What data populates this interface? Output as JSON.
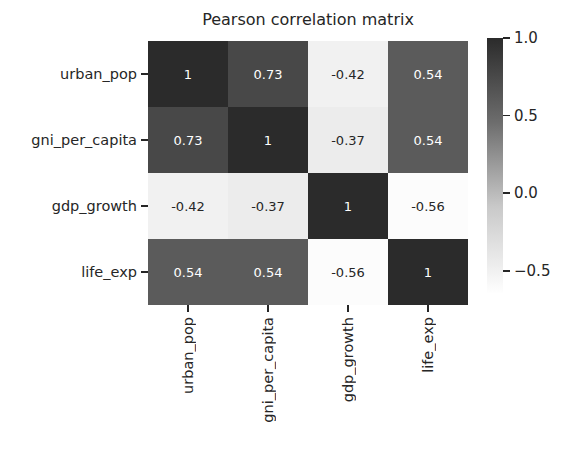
{
  "chart_data": {
    "type": "heatmap",
    "title": "Pearson correlation matrix",
    "xlabel": "",
    "ylabel": "",
    "categories": [
      "urban_pop",
      "gni_per_capita",
      "gdp_growth",
      "life_exp"
    ],
    "x_tick_labels": [
      "urban_pop",
      "gni_per_capita",
      "gdp_growth",
      "life_exp"
    ],
    "y_tick_labels": [
      "urban_pop",
      "gni_per_capita",
      "gdp_growth",
      "life_exp"
    ],
    "rows": [
      {
        "label": "urban_pop",
        "cells": [
          {
            "value": "1",
            "num": 1.0,
            "bg": "#2b2b2b",
            "fg": "#ffffff"
          },
          {
            "value": "0.73",
            "num": 0.73,
            "bg": "#484848",
            "fg": "#ffffff"
          },
          {
            "value": "-0.42",
            "num": -0.42,
            "bg": "#f1f1f1",
            "fg": "#262626"
          },
          {
            "value": "0.54",
            "num": 0.54,
            "bg": "#5b5b5b",
            "fg": "#ffffff"
          }
        ]
      },
      {
        "label": "gni_per_capita",
        "cells": [
          {
            "value": "0.73",
            "num": 0.73,
            "bg": "#484848",
            "fg": "#ffffff"
          },
          {
            "value": "1",
            "num": 1.0,
            "bg": "#2b2b2b",
            "fg": "#ffffff"
          },
          {
            "value": "-0.37",
            "num": -0.37,
            "bg": "#ececec",
            "fg": "#262626"
          },
          {
            "value": "0.54",
            "num": 0.54,
            "bg": "#5b5b5b",
            "fg": "#ffffff"
          }
        ]
      },
      {
        "label": "gdp_growth",
        "cells": [
          {
            "value": "-0.42",
            "num": -0.42,
            "bg": "#f1f1f1",
            "fg": "#262626"
          },
          {
            "value": "-0.37",
            "num": -0.37,
            "bg": "#ececec",
            "fg": "#262626"
          },
          {
            "value": "1",
            "num": 1.0,
            "bg": "#2b2b2b",
            "fg": "#ffffff"
          },
          {
            "value": "-0.56",
            "num": -0.56,
            "bg": "#fcfcfc",
            "fg": "#262626"
          }
        ]
      },
      {
        "label": "life_exp",
        "cells": [
          {
            "value": "0.54",
            "num": 0.54,
            "bg": "#5b5b5b",
            "fg": "#ffffff"
          },
          {
            "value": "0.54",
            "num": 0.54,
            "bg": "#5b5b5b",
            "fg": "#ffffff"
          },
          {
            "value": "-0.56",
            "num": -0.56,
            "bg": "#fcfcfc",
            "fg": "#262626"
          },
          {
            "value": "1",
            "num": 1.0,
            "bg": "#2b2b2b",
            "fg": "#ffffff"
          }
        ]
      }
    ],
    "colorbar": {
      "colormap": "grayscale-reversed",
      "top_color": "#2b2b2b",
      "bottom_color": "#ffffff",
      "vmin": -0.65,
      "vmax": 1.0,
      "ticks": [
        {
          "label": "1.0",
          "value": 1.0
        },
        {
          "label": "0.5",
          "value": 0.5
        },
        {
          "label": "0.0",
          "value": 0.0
        },
        {
          "label": "−0.5",
          "value": -0.5
        }
      ]
    },
    "grid": false,
    "legend_position": "right"
  }
}
